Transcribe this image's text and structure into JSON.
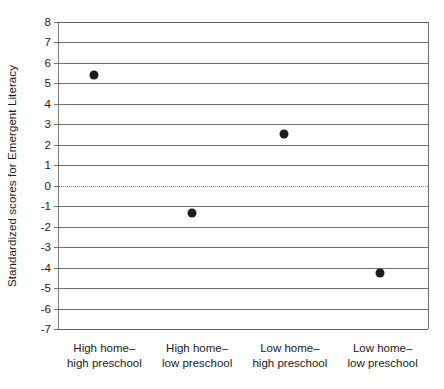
{
  "chart_data": {
    "type": "scatter",
    "title": "",
    "xlabel": "",
    "ylabel": "Standardized scores for Emergent Literacy",
    "ylim": [
      -7,
      8
    ],
    "yticks": [
      8,
      7,
      6,
      5,
      4,
      3,
      2,
      1,
      0,
      -1,
      -2,
      -3,
      -4,
      -5,
      -6,
      -7
    ],
    "ytick_labels": [
      "8",
      "7",
      "6",
      "5",
      "4",
      "3",
      "2",
      "1",
      "0",
      "-1",
      "-2",
      "-3",
      "-4",
      "-5",
      "-6",
      "-7"
    ],
    "grid": true,
    "grid_axis": "y",
    "zero_reference_line": true,
    "legend": false,
    "categories": [
      "High home–high preschool",
      "High home–low preschool",
      "Low home–high preschool",
      "Low home–low preschool"
    ],
    "category_lines": [
      [
        "High home–",
        "high preschool"
      ],
      [
        "High home–",
        "low preschool"
      ],
      [
        "Low home–",
        "high preschool"
      ],
      [
        "Low home–",
        "low preschool"
      ]
    ],
    "values": [
      5.4,
      -1.35,
      2.55,
      -4.25
    ],
    "point_x_fraction": [
      0.095,
      0.36,
      0.61,
      0.87
    ],
    "marker": "filled-circle",
    "marker_color": "#1c1c1c",
    "axis_color": "#6f6f6f",
    "background_color": "#ffffff"
  }
}
